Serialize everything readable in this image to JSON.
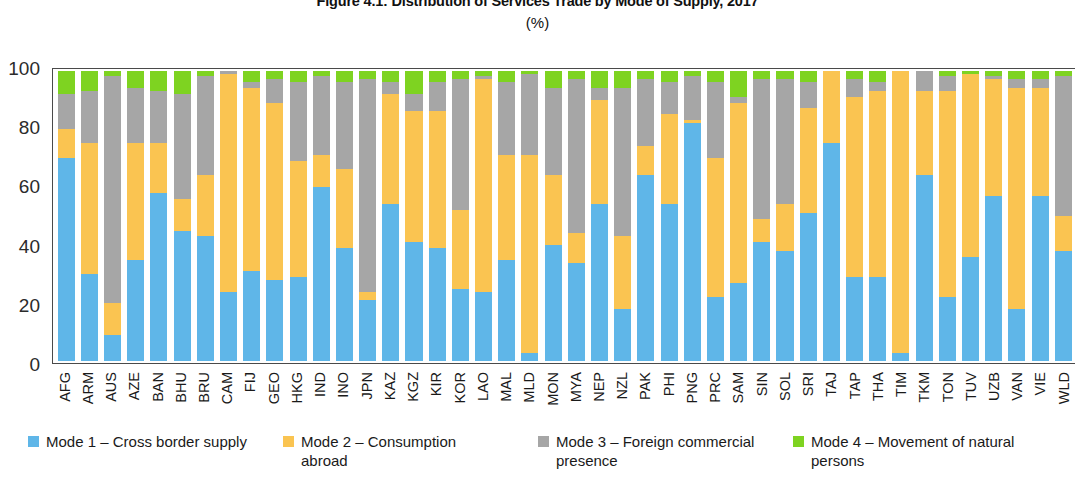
{
  "header": {
    "title": "Figure 4.1: Distribution of Services Trade by Mode of Supply, 2017",
    "subtitle": "(%)"
  },
  "legend": {
    "position": "bottom",
    "items": [
      {
        "key": "m1",
        "label": "Mode 1 – Cross border supply",
        "color": "#5fb6e8"
      },
      {
        "key": "m2",
        "label": "Mode 2 – Consumption abroad",
        "color": "#fac451"
      },
      {
        "key": "m3",
        "label": "Mode 3 – Foreign commercial presence",
        "color": "#a6a6a6"
      },
      {
        "key": "m4",
        "label": "Mode 4 – Movement of natural persons",
        "color": "#7ed321"
      }
    ]
  },
  "axes": {
    "y_ticks": [
      "0",
      "20",
      "40",
      "60",
      "80",
      "100"
    ],
    "y_min": 0,
    "y_max": 100
  },
  "chart_data": {
    "type": "bar",
    "stacked": true,
    "title": "Figure 4.1: Distribution of Services Trade by Mode of Supply, 2017",
    "subtitle": "(%)",
    "xlabel": "",
    "ylabel": "(%)",
    "ylim": [
      0,
      100
    ],
    "grid": false,
    "legend_position": "bottom",
    "categories": [
      "AFG",
      "ARM",
      "AUS",
      "AZE",
      "BAN",
      "BHU",
      "BRU",
      "CAM",
      "FIJ",
      "GEO",
      "HKG",
      "IND",
      "INO",
      "JPN",
      "KAZ",
      "KGZ",
      "KIR",
      "KOR",
      "LAO",
      "MAL",
      "MLD",
      "MON",
      "MYA",
      "NEP",
      "NZL",
      "PAK",
      "PHI",
      "PNG",
      "PRC",
      "SAM",
      "SIN",
      "SOL",
      "SRI",
      "TAJ",
      "TAP",
      "THA",
      "TIM",
      "TKM",
      "TON",
      "TUV",
      "UZB",
      "VAN",
      "VIE",
      "WLD"
    ],
    "series": [
      {
        "name": "Mode 1 – Cross border supply",
        "color": "#5fb6e8",
        "values": [
          70,
          30,
          9,
          35,
          58,
          45,
          43,
          24,
          31,
          28,
          29,
          60,
          39,
          21,
          54,
          41,
          39,
          25,
          24,
          35,
          3,
          40,
          34,
          54,
          18,
          64,
          54,
          82,
          22,
          27,
          41,
          38,
          51,
          76,
          29,
          29,
          3,
          64,
          22,
          36,
          57,
          18,
          57,
          38
        ]
      },
      {
        "name": "Mode 2 – Consumption abroad",
        "color": "#fac451",
        "values": [
          10,
          45,
          11,
          40,
          17,
          11,
          21,
          75,
          63,
          61,
          40,
          11,
          27,
          3,
          38,
          45,
          47,
          27,
          73,
          36,
          68,
          24,
          10,
          36,
          25,
          10,
          31,
          1,
          48,
          62,
          8,
          16,
          36,
          25,
          62,
          64,
          97,
          29,
          71,
          63,
          40,
          76,
          37,
          12
        ]
      },
      {
        "name": "Mode 3 – Foreign commercial presence",
        "color": "#a6a6a6",
        "values": [
          12,
          18,
          78,
          19,
          18,
          36,
          34,
          1,
          2,
          8,
          27,
          27,
          30,
          73,
          4,
          6,
          10,
          45,
          1,
          25,
          28,
          30,
          53,
          4,
          51,
          23,
          11,
          15,
          26,
          2,
          48,
          43,
          9,
          0,
          6,
          3,
          0,
          7,
          5,
          0,
          1,
          3,
          3,
          48
        ]
      },
      {
        "name": "Mode 4 – Movement of natural persons",
        "color": "#7ed321",
        "values": [
          8,
          7,
          2,
          6,
          7,
          8,
          2,
          0,
          4,
          3,
          4,
          2,
          4,
          3,
          4,
          8,
          4,
          3,
          2,
          4,
          1,
          6,
          3,
          6,
          6,
          3,
          4,
          2,
          4,
          9,
          3,
          3,
          4,
          0,
          3,
          4,
          0,
          0,
          2,
          1,
          2,
          3,
          3,
          2
        ]
      }
    ]
  }
}
